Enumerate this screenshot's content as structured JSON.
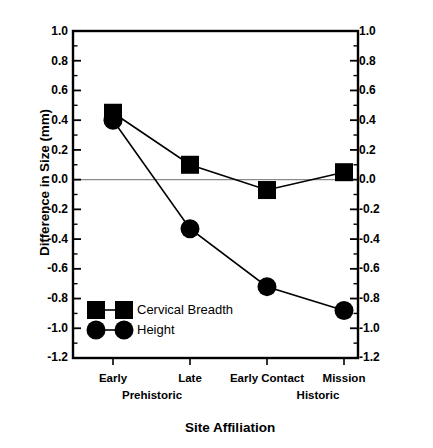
{
  "chart_data": {
    "type": "line",
    "title": "",
    "xlabel": "Site Affiliation",
    "ylabel": "Difference in Size (mm)",
    "categories": [
      "Early",
      "Late",
      "Early Contact",
      "Mission"
    ],
    "group_labels": [
      "Prehistoric",
      "Historic"
    ],
    "ylim": [
      -1.2,
      1.0
    ],
    "y_ticks": [
      "1.0",
      "0.8",
      "0.6",
      "0.4",
      "0.2",
      "0.0",
      "-0.2",
      "-0.4",
      "-0.6",
      "-0.8",
      "-1.0",
      "-1.2"
    ],
    "y_tick_values": [
      1.0,
      0.8,
      0.6,
      0.4,
      0.2,
      0.0,
      -0.2,
      -0.4,
      -0.6,
      -0.8,
      -1.0,
      -1.2
    ],
    "y_minor_step": 0.1,
    "grid": false,
    "zero_line": true,
    "mirrored_right_axis": true,
    "legend_position": "lower-left-inside",
    "series": [
      {
        "name": "Cervical Breadth",
        "marker": "square",
        "color": "#000000",
        "values": [
          0.45,
          0.1,
          -0.07,
          0.05
        ]
      },
      {
        "name": "Height",
        "marker": "circle",
        "color": "#000000",
        "values": [
          0.4,
          -0.33,
          -0.72,
          -0.88
        ]
      }
    ]
  },
  "axes": {
    "y_title": "Difference in Size (mm)",
    "x_title": "Site Affiliation",
    "y_labels_left": [
      "1.0",
      "0.8",
      "0.6",
      "0.4",
      "0.2",
      "0.0",
      "-0.2",
      "-0.4",
      "-0.6",
      "-0.8",
      "-1.0",
      "-1.2"
    ],
    "y_labels_right": [
      "1.0",
      "0.8",
      "0.6",
      "0.4",
      "0.2",
      "0.0",
      "-0.2",
      "-0.4",
      "-0.6",
      "-0.8",
      "-1.0",
      "-1.2"
    ],
    "x_labels": [
      "Early",
      "Late",
      "Early Contact",
      "Mission"
    ],
    "x_group_labels": [
      "Prehistoric",
      "Historic"
    ]
  },
  "legend": {
    "entries": [
      {
        "label": "Cervical Breadth",
        "marker": "square"
      },
      {
        "label": "Height",
        "marker": "circle"
      }
    ]
  },
  "colors": {
    "ink": "#000000",
    "zero_line": "#8a8a8a",
    "background": "#ffffff"
  }
}
